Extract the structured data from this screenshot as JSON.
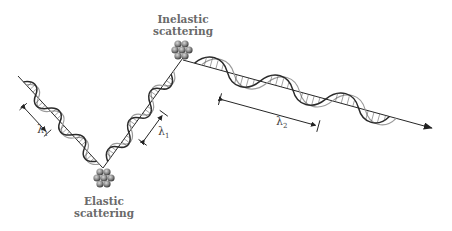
{
  "labels": {
    "inelastic": [
      "Inelastic",
      "scattering"
    ],
    "elastic": [
      "Elastic",
      "scattering"
    ]
  },
  "wavelengths": {
    "lambda1_left": {
      "symbol": "λ",
      "sub": "1"
    },
    "lambda1_right": {
      "symbol": "λ",
      "sub": "1"
    },
    "lambda2": {
      "symbol": "λ",
      "sub": "2"
    }
  },
  "colors": {
    "line": "#222222",
    "wave_dark": "#2a2a2a",
    "wave_light": "#9a9a9a",
    "nucleus": "#7a7a7a",
    "label": "#6a6a6a"
  }
}
